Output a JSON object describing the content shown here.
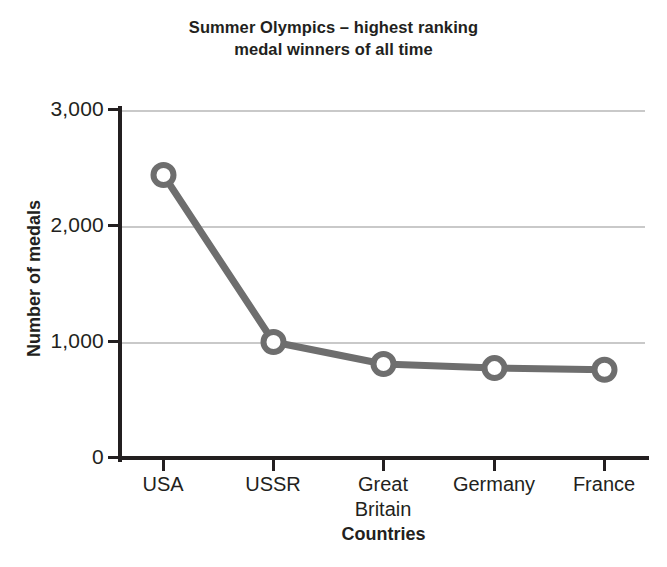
{
  "chart_data": {
    "type": "line",
    "title": "Summer Olympics – highest ranking medal winners of all time",
    "title_lines": [
      "Summer Olympics – highest ranking",
      "medal winners of all time"
    ],
    "categories": [
      "USA",
      "USSR",
      "Great Britain",
      "Germany",
      "France"
    ],
    "category_lines": [
      [
        "USA"
      ],
      [
        "USSR"
      ],
      [
        "Great",
        "Britain"
      ],
      [
        "Germany"
      ],
      [
        "France"
      ]
    ],
    "values": [
      2440,
      1000,
      810,
      775,
      760
    ],
    "series": [
      {
        "name": "Number of medals",
        "values": [
          2440,
          1000,
          810,
          775,
          760
        ]
      }
    ],
    "xlabel": "Countries",
    "ylabel": "Number of medals",
    "ylim": [
      0,
      3000
    ],
    "yticks": [
      0,
      1000,
      2000,
      3000
    ],
    "ytick_labels": [
      "0",
      "1,000",
      "2,000",
      "3,000"
    ],
    "grid": "horizontal",
    "legend": "none",
    "marker": "open-circle",
    "colors": {
      "line": "#6e6e6e",
      "marker_stroke": "#6e6e6e",
      "marker_fill": "#ffffff",
      "axis": "#231f20",
      "gridline": "#c9c9c9",
      "text": "#231f20",
      "background": "#ffffff"
    }
  }
}
